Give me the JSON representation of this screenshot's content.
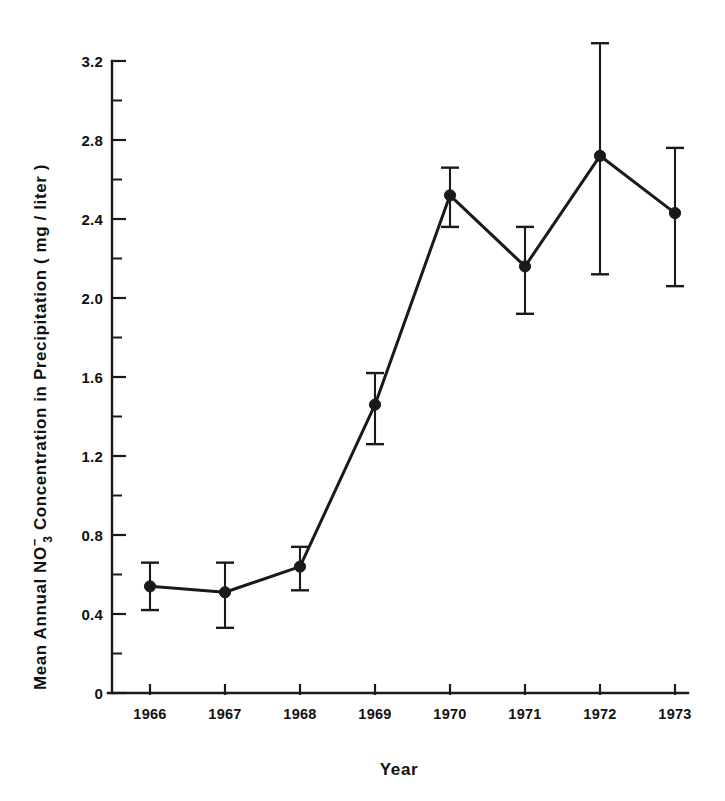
{
  "chart_data": {
    "type": "line",
    "title": "",
    "xlabel": "Year",
    "ylabel": "Mean Annual NO₃⁻ Concentration in Precipitation ( mg / liter )",
    "ylabel_parts": {
      "prefix": "Mean Annual NO",
      "sub": "3",
      "sup": "−",
      "suffix": " Concentration in Precipitation ( mg / liter )"
    },
    "categories": [
      "1966",
      "1967",
      "1968",
      "1969",
      "1970",
      "1971",
      "1972",
      "1973"
    ],
    "x": [
      1966,
      1967,
      1968,
      1969,
      1970,
      1971,
      1972,
      1973
    ],
    "values": [
      0.54,
      0.51,
      0.64,
      1.46,
      2.52,
      2.16,
      2.72,
      2.43
    ],
    "error_low": [
      0.42,
      0.33,
      0.52,
      1.26,
      2.36,
      1.92,
      2.12,
      2.06
    ],
    "error_high": [
      0.66,
      0.66,
      0.74,
      1.62,
      2.66,
      2.36,
      3.29,
      2.76
    ],
    "error_minus": [
      0.12,
      0.18,
      0.12,
      0.2,
      0.16,
      0.24,
      0.6,
      0.37
    ],
    "error_plus": [
      0.12,
      0.15,
      0.1,
      0.16,
      0.14,
      0.2,
      0.57,
      0.33
    ],
    "ylim": [
      0,
      3.2
    ],
    "xlim": [
      1965.5,
      1973.5
    ],
    "ytick_values": [
      0,
      0.4,
      0.8,
      1.2,
      1.6,
      2.0,
      2.4,
      2.8,
      3.2
    ],
    "ytick_labels": [
      "0",
      "0.4",
      "0.8",
      "1.2",
      "1.6",
      "2.0",
      "2.4",
      "2.8",
      "3.2"
    ],
    "yminor_values": [
      0.2,
      0.6,
      1.0,
      1.4,
      1.8,
      2.2,
      2.6,
      3.0
    ],
    "xtick_labels": [
      "1966",
      "1967",
      "1968",
      "1969",
      "1970",
      "1971",
      "1972",
      "1973"
    ],
    "grid": false,
    "legend": null,
    "series": [
      {
        "name": "Mean Annual NO3- Concentration",
        "values": [
          0.54,
          0.51,
          0.64,
          1.46,
          2.52,
          2.16,
          2.72,
          2.43
        ],
        "marker": "filled-circle",
        "color": "#1a1a1a"
      }
    ],
    "colors": {
      "line": "#1a1a1a",
      "marker": "#1a1a1a",
      "axis": "#1a1a1a",
      "background": "#ffffff",
      "text": "#111111"
    }
  }
}
